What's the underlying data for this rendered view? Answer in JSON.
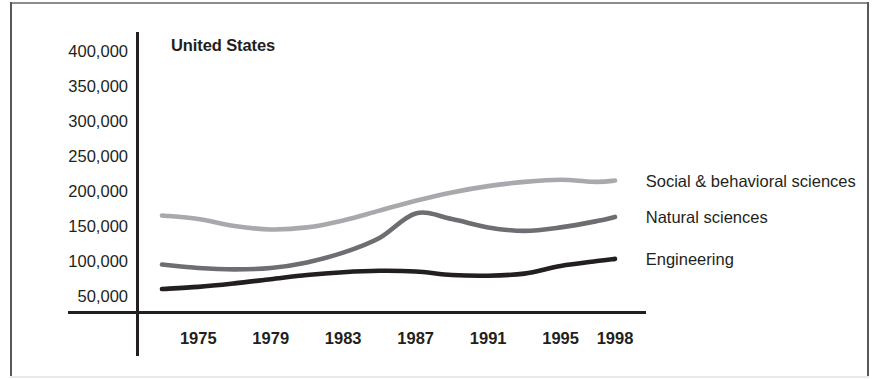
{
  "figure": {
    "title": "United States"
  },
  "chart_data": {
    "type": "line",
    "title": "United States",
    "xlabel": "",
    "ylabel": "",
    "grid": false,
    "legend_position": "right-inline-labels",
    "xlim": [
      1973,
      1999
    ],
    "ylim": [
      0,
      425000
    ],
    "x_ticks": [
      1975,
      1979,
      1983,
      1987,
      1991,
      1995,
      1998
    ],
    "x_tick_labels": [
      "1975",
      "1979",
      "1983",
      "1987",
      "1991",
      "1995",
      "1998"
    ],
    "y_ticks": [
      50000,
      100000,
      150000,
      200000,
      250000,
      300000,
      350000,
      400000
    ],
    "y_tick_labels": [
      "50,000",
      "100,000",
      "150,000",
      "200,000",
      "250,000",
      "300,000",
      "350,000",
      "400,000"
    ],
    "series": [
      {
        "name": "Social & behavioral sciences",
        "color": "#a7a9ac",
        "label_x": 1999.2,
        "label_value": 215000,
        "x": [
          1973,
          1975,
          1977,
          1979,
          1981,
          1983,
          1985,
          1987,
          1989,
          1991,
          1993,
          1995,
          1997,
          1998
        ],
        "values": [
          165000,
          160000,
          150000,
          145000,
          148000,
          158000,
          172000,
          186000,
          198000,
          207000,
          213000,
          216000,
          213000,
          215000
        ]
      },
      {
        "name": "Natural sciences",
        "color": "#6d6e71",
        "label_x": 1999.2,
        "label_value": 163000,
        "x": [
          1973,
          1975,
          1977,
          1979,
          1981,
          1983,
          1985,
          1987,
          1989,
          1991,
          1993,
          1995,
          1997,
          1998
        ],
        "values": [
          95000,
          90000,
          88000,
          90000,
          98000,
          112000,
          133000,
          168000,
          160000,
          148000,
          143000,
          148000,
          157000,
          163000
        ]
      },
      {
        "name": "Engineering",
        "color": "#231f20",
        "label_x": 1999.2,
        "label_value": 103000,
        "x": [
          1973,
          1975,
          1977,
          1979,
          1981,
          1983,
          1985,
          1987,
          1989,
          1991,
          1993,
          1995,
          1997,
          1998
        ],
        "values": [
          60000,
          63000,
          68000,
          74000,
          80000,
          84000,
          86000,
          85000,
          80000,
          79000,
          82000,
          93000,
          100000,
          103000
        ]
      }
    ]
  },
  "series_labels": [
    {
      "text": "Social & behavioral sciences"
    },
    {
      "text": "Natural sciences"
    },
    {
      "text": "Engineering"
    }
  ],
  "colors": {
    "social": "#a7a9ac",
    "natural": "#6d6e71",
    "engineering": "#231f20",
    "axis": "#231f20",
    "frame": "#58585a"
  }
}
